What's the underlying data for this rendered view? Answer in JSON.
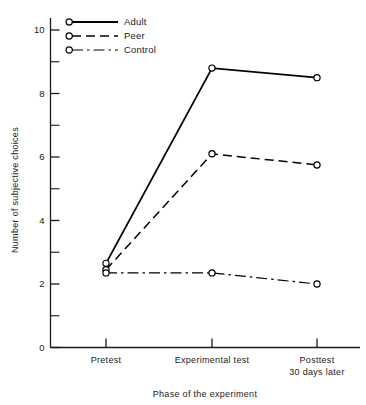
{
  "chart_data": {
    "type": "line",
    "title": "",
    "xlabel": "Phase of the experiment",
    "ylabel": "Number of subjective choices",
    "categories": [
      "Pretest",
      "Experimental test",
      "Posttest\n30 days later"
    ],
    "category_lines": [
      [
        "Pretest"
      ],
      [
        "Experimental test"
      ],
      [
        "Posttest",
        "30 days later"
      ]
    ],
    "x": [
      0,
      1,
      2
    ],
    "ylim": [
      0,
      10.3
    ],
    "xlim": [
      -0.55,
      2.45
    ],
    "yticks": [
      0,
      2,
      4,
      6,
      8,
      10
    ],
    "ytick_labels": [
      "0",
      "2",
      "4",
      "6",
      "8",
      "10"
    ],
    "yminorticks": [
      1,
      3,
      5,
      7,
      9
    ],
    "grid": false,
    "legend_position": "top-left-inside",
    "series": [
      {
        "name": "Adult",
        "values": [
          2.65,
          8.8,
          8.5
        ],
        "line_style": "solid",
        "marker": "open-circle",
        "color": "#000000",
        "line_width": 1.8
      },
      {
        "name": "Peer",
        "values": [
          2.45,
          6.1,
          5.75
        ],
        "line_style": "dashed",
        "marker": "open-circle",
        "color": "#000000",
        "line_width": 1.5
      },
      {
        "name": "Control",
        "values": [
          2.35,
          2.35,
          2.0
        ],
        "line_style": "dashdot",
        "marker": "open-circle",
        "color": "#000000",
        "line_width": 1.2
      }
    ]
  },
  "axes": {
    "y_label_text": "Number of subjective choices",
    "x_label_text": "Phase of the experiment"
  },
  "legend": {
    "entries": [
      {
        "label": "Adult"
      },
      {
        "label": "Peer"
      },
      {
        "label": "Control"
      }
    ]
  },
  "ticks": {
    "y": [
      {
        "label": "10"
      },
      {
        "label": "8"
      },
      {
        "label": "6"
      },
      {
        "label": "4"
      },
      {
        "label": "2"
      },
      {
        "label": "0"
      }
    ],
    "x": [
      {
        "line1": "Pretest",
        "line2": ""
      },
      {
        "line1": "Experimental test",
        "line2": ""
      },
      {
        "line1": "Posttest",
        "line2": "30 days later"
      }
    ]
  },
  "colors": {
    "ink": "#1a1a1a",
    "line": "#000000",
    "background": "#ffffff"
  }
}
